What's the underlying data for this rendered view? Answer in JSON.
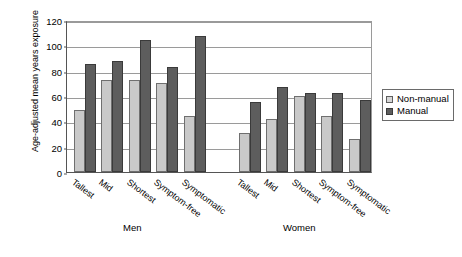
{
  "chart_data": {
    "type": "bar",
    "title": "",
    "xlabel": "",
    "ylabel": "Age-adjusted mean years exposure",
    "ylim": [
      0,
      120
    ],
    "yticks": [
      0,
      20,
      40,
      60,
      80,
      100,
      120
    ],
    "grid": true,
    "legend_position": "right",
    "groups": [
      {
        "name": "Men",
        "categories": [
          "Tallest",
          "Mid",
          "Shortest",
          "Symptom-free",
          "Symptomatic"
        ]
      },
      {
        "name": "Women",
        "categories": [
          "Tallest",
          "Mid",
          "Shortest",
          "Symptom-free",
          "Symptomatic"
        ]
      }
    ],
    "categories": [
      "Men / Tallest",
      "Men / Mid",
      "Men / Shortest",
      "Men / Symptom-free",
      "Men / Symptomatic",
      "Women / Tallest",
      "Women / Mid",
      "Women / Shortest",
      "Women / Symptom-free",
      "Women / Symptomatic"
    ],
    "series": [
      {
        "name": "Non-manual",
        "color": "#c9c9c9",
        "values": [
          49,
          73,
          73,
          70,
          44,
          31,
          42,
          60,
          44,
          26
        ]
      },
      {
        "name": "Manual",
        "color": "#5d5d5d",
        "values": [
          85,
          88,
          104,
          83,
          107,
          55,
          67,
          62,
          62,
          57
        ]
      }
    ]
  },
  "axis": {
    "y_title": "Age-adjusted mean years exposure",
    "tick_labels": [
      "120",
      "100",
      "80",
      "60",
      "40",
      "20",
      "0"
    ]
  },
  "groups_labels": {
    "men": "Men",
    "women": "Women"
  },
  "categories_men": [
    "Tallest",
    "Mid",
    "Shortest",
    "Symptom-free",
    "Symptomatic"
  ],
  "categories_women": [
    "Tallest",
    "Mid",
    "Shortest",
    "Symptom-free",
    "Symptomatic"
  ],
  "legend": {
    "items": [
      {
        "label": "Non-manual",
        "color": "#c9c9c9"
      },
      {
        "label": "Manual",
        "color": "#5d5d5d"
      }
    ]
  }
}
